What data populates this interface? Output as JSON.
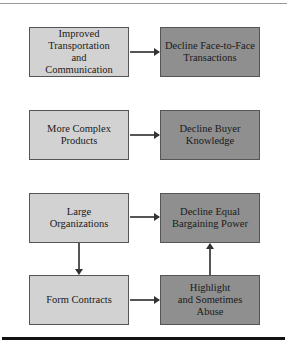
{
  "diagram": {
    "nodes": {
      "improved_transport": "Improved\nTransportation\nand\nCommunication",
      "decline_face_to_face": "Decline Face-to-Face\nTransactions",
      "more_complex_products": "More Complex\nProducts",
      "decline_buyer_knowledge": "Decline Buyer\nKnowledge",
      "large_organizations": "Large\nOrganizations",
      "decline_equal_bargaining": "Decline Equal\nBargaining Power",
      "form_contracts": "Form Contracts",
      "highlight_abuse": "Highlight\nand Sometimes\nAbuse"
    },
    "edges": [
      {
        "from": "improved_transport",
        "to": "decline_face_to_face"
      },
      {
        "from": "more_complex_products",
        "to": "decline_buyer_knowledge"
      },
      {
        "from": "large_organizations",
        "to": "decline_equal_bargaining"
      },
      {
        "from": "large_organizations",
        "to": "form_contracts"
      },
      {
        "from": "form_contracts",
        "to": "highlight_abuse"
      },
      {
        "from": "highlight_abuse",
        "to": "decline_equal_bargaining"
      }
    ],
    "colors": {
      "cause_fill": "#d2d2d2",
      "effect_fill": "#8f8f8f"
    }
  }
}
